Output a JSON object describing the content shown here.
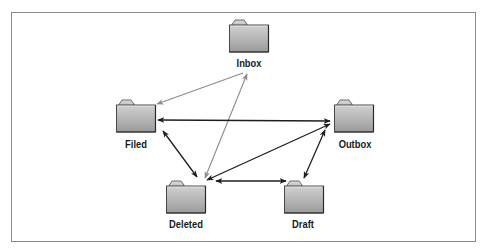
{
  "diagram": {
    "title": "",
    "frame": {
      "border_color": "#8a8a8a"
    },
    "colors": {
      "strong_arrow": "#1e1e1e",
      "light_arrow": "#8c8c8c",
      "folder_fill_top": "#c8c8c8",
      "folder_fill_bottom": "#9a9a9a",
      "folder_outline": "#3a3a3a"
    },
    "nodes": [
      {
        "id": "inbox",
        "label": "Inbox",
        "icon": "folder-icon",
        "x": 229,
        "y": 20,
        "label_x": 249,
        "label_y": 57
      },
      {
        "id": "filed",
        "label": "Filed",
        "icon": "folder-icon",
        "x": 116,
        "y": 100,
        "label_x": 136,
        "label_y": 138
      },
      {
        "id": "outbox",
        "label": "Outbox",
        "icon": "folder-icon",
        "x": 333,
        "y": 100,
        "label_x": 355,
        "label_y": 138
      },
      {
        "id": "deleted",
        "label": "Deleted",
        "icon": "folder-icon",
        "x": 166,
        "y": 181,
        "label_x": 186,
        "label_y": 218
      },
      {
        "id": "draft",
        "label": "Draft",
        "icon": "folder-icon",
        "x": 284,
        "y": 181,
        "label_x": 303,
        "label_y": 218
      }
    ],
    "edges": [
      {
        "from": "inbox",
        "to": "filed",
        "style": "light",
        "direction": "forward"
      },
      {
        "from": "inbox",
        "to": "deleted",
        "style": "light",
        "direction": "both"
      },
      {
        "from": "filed",
        "to": "outbox",
        "style": "strong",
        "direction": "both"
      },
      {
        "from": "filed",
        "to": "deleted",
        "style": "strong",
        "direction": "both"
      },
      {
        "from": "outbox",
        "to": "deleted",
        "style": "strong",
        "direction": "both"
      },
      {
        "from": "outbox",
        "to": "draft",
        "style": "strong",
        "direction": "both"
      },
      {
        "from": "deleted",
        "to": "draft",
        "style": "strong",
        "direction": "both"
      }
    ]
  }
}
